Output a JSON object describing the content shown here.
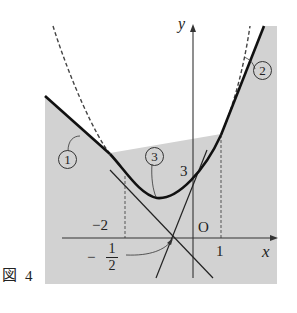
{
  "figure": {
    "caption_label": "図",
    "caption_number": "4"
  },
  "axes": {
    "x_label": "x",
    "y_label": "y",
    "origin_label": "O"
  },
  "ticks": {
    "x_neg2": "−2",
    "x_1": "1",
    "y_3": "3",
    "x_neg_half_sign": "−",
    "x_neg_half_num": "1",
    "x_neg_half_den": "2"
  },
  "curve_labels": {
    "c1": "1",
    "c2": "2",
    "c3": "3"
  },
  "colors": {
    "shade": "#d2d2d2",
    "curve": "#111111",
    "axis": "#333333",
    "dashed": "#444444"
  }
}
